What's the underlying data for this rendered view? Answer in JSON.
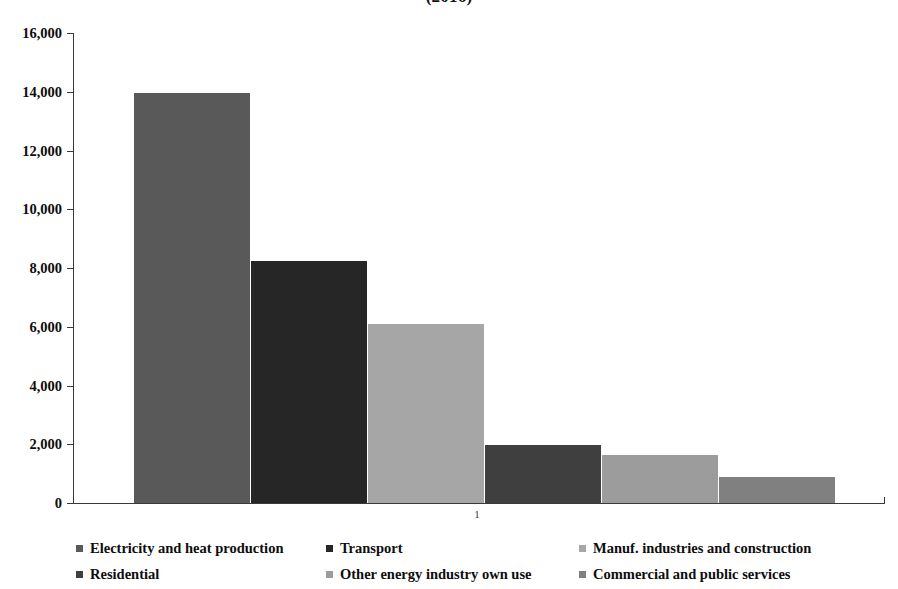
{
  "chart_data": {
    "type": "bar",
    "title": "(2016)",
    "xlabel": "",
    "ylabel": "",
    "categories": [
      "1"
    ],
    "x_tick_labels": [
      "1"
    ],
    "ylim": [
      0,
      16000
    ],
    "y_tick_values": [
      0,
      2000,
      4000,
      6000,
      8000,
      10000,
      12000,
      14000,
      16000
    ],
    "y_tick_labels": [
      "0",
      "2,000",
      "4,000",
      "6,000",
      "8,000",
      "10,000",
      "12,000",
      "14,000",
      "16,000"
    ],
    "grid": false,
    "legend_position": "bottom",
    "series": [
      {
        "name": "Electricity and heat production",
        "values": [
          13950
        ],
        "color": "#595959"
      },
      {
        "name": "Transport",
        "values": [
          8250
        ],
        "color": "#262626"
      },
      {
        "name": "Manuf. industries and construction",
        "values": [
          6100
        ],
        "color": "#a6a6a6"
      },
      {
        "name": "Residential",
        "values": [
          1980
        ],
        "color": "#3f3f3f"
      },
      {
        "name": "Other energy  industry own use",
        "values": [
          1640
        ],
        "color": "#9c9c9c"
      },
      {
        "name": "Commercial and public services",
        "values": [
          870
        ],
        "color": "#808080"
      }
    ]
  },
  "axis": {
    "y_labels": [
      "16,000",
      "14,000",
      "12,000",
      "10,000",
      "8,000",
      "6,000",
      "4,000",
      "2,000",
      "0"
    ],
    "x_label": "1"
  },
  "legend": {
    "items": [
      {
        "label": "Electricity and heat production",
        "color": "#595959"
      },
      {
        "label": "Transport",
        "color": "#262626"
      },
      {
        "label": "Manuf. industries and construction",
        "color": "#a6a6a6"
      },
      {
        "label": "Residential",
        "color": "#3f3f3f"
      },
      {
        "label": "Other energy  industry own use",
        "color": "#9c9c9c"
      },
      {
        "label": "Commercial and public services",
        "color": "#808080"
      }
    ]
  }
}
